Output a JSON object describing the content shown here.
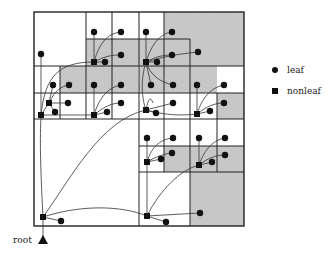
{
  "legend": {
    "leaf_label": "leaf",
    "nonleaf_label": "nonleaf"
  },
  "root_label": "root",
  "colors": {
    "line": "#222222",
    "shade": "#c8c8c8",
    "node": "#111111"
  },
  "shaded_cells": [
    [
      86,
      39,
      78,
      27
    ],
    [
      164,
      12,
      80,
      54
    ],
    [
      164,
      66,
      53,
      27
    ],
    [
      60,
      66,
      26,
      27
    ],
    [
      86,
      66,
      26,
      27
    ],
    [
      112,
      66,
      26,
      27
    ],
    [
      139,
      66,
      25,
      27
    ],
    [
      190,
      146,
      54,
      26
    ],
    [
      164,
      146,
      26,
      26
    ],
    [
      190,
      172,
      54,
      54
    ],
    [
      217,
      93,
      27,
      26
    ]
  ],
  "grid_lines": {
    "rects": [
      [
        34,
        12,
        210,
        214
      ]
    ],
    "h": [
      [
        34,
        139,
        119
      ],
      [
        139,
        244,
        119
      ],
      [
        34,
        139,
        66
      ],
      [
        34,
        139,
        93
      ],
      [
        86,
        190,
        39
      ],
      [
        139,
        244,
        66
      ],
      [
        139,
        244,
        93
      ],
      [
        139,
        244,
        146
      ],
      [
        139,
        244,
        172
      ],
      [
        164,
        244,
        39
      ]
    ],
    "v": [
      [
        139,
        12,
        226
      ],
      [
        86,
        12,
        119
      ],
      [
        60,
        66,
        119
      ],
      [
        112,
        12,
        119
      ],
      [
        164,
        12,
        172
      ],
      [
        190,
        66,
        226
      ],
      [
        217,
        93,
        172
      ],
      [
        190,
        12,
        39
      ]
    ]
  }
}
